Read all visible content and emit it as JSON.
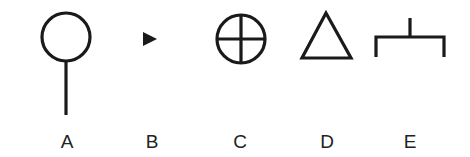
{
  "symbols": [
    {
      "id": "A",
      "label": "A",
      "icon": "circle-on-stem-icon"
    },
    {
      "id": "B",
      "label": "B",
      "icon": "small-filled-right-triangle-icon"
    },
    {
      "id": "C",
      "label": "C",
      "icon": "circle-with-cross-icon"
    },
    {
      "id": "D",
      "label": "D",
      "icon": "outline-triangle-icon"
    },
    {
      "id": "E",
      "label": "E",
      "icon": "bracket-with-stem-icon"
    }
  ],
  "colors": {
    "stroke": "#1a1a1a",
    "label": "#222222",
    "background": "#ffffff"
  }
}
